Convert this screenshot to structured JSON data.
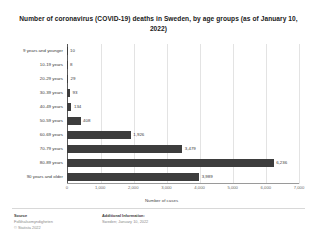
{
  "chart_data": {
    "type": "bar",
    "orientation": "horizontal",
    "title": "Number of coronavirus (COVID-19) deaths in Sweden, by age groups (as of January 10, 2022)",
    "xlabel": "Number of cases",
    "ylabel": "",
    "categories": [
      "9 years and younger",
      "10-19 years",
      "20-29 years",
      "30-39 years",
      "40-49 years",
      "50-59 years",
      "60-69 years",
      "70-79 years",
      "80-89 years",
      "90 years and older"
    ],
    "values": [
      10,
      8,
      29,
      93,
      134,
      408,
      1926,
      3479,
      6236,
      3989
    ],
    "value_labels": [
      "10",
      "8",
      "29",
      "93",
      "134",
      "408",
      "1,926",
      "3,479",
      "6,236",
      "3,989"
    ],
    "xlim": [
      0,
      7000
    ],
    "xticks": [
      0,
      1000,
      2000,
      3000,
      4000,
      5000,
      6000,
      7000
    ],
    "xtick_labels": [
      "0",
      "1,000",
      "2,000",
      "3,000",
      "4,000",
      "5,000",
      "6,000",
      "7,000"
    ],
    "grid": true,
    "legend": null,
    "bar_color": "#3d3d3d"
  },
  "footer": {
    "source_heading": "Source",
    "source_lines": [
      "Folkhalsomyndigheten",
      "© Statista 2022"
    ],
    "additional_heading": "Additional Information:",
    "additional_lines": [
      "Sweden; January 10, 2022"
    ]
  }
}
